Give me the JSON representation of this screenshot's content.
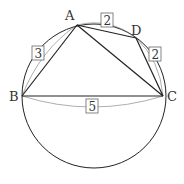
{
  "diagram": {
    "type": "geometry-cyclic-quadrilateral",
    "colors": {
      "stroke": "#222222",
      "arc": "#555555",
      "label_box": "#666666",
      "text": "#333333",
      "background": "#ffffff"
    },
    "circle": {
      "cx": 94,
      "cy": 96,
      "r": 72
    },
    "points": [
      {
        "name": "A",
        "label": "A",
        "x": 77,
        "y": 25,
        "lx": 70,
        "ly": 19
      },
      {
        "name": "B",
        "label": "B",
        "x": 22,
        "y": 96,
        "lx": 10,
        "ly": 101
      },
      {
        "name": "C",
        "label": "C",
        "x": 163,
        "y": 96,
        "lx": 167,
        "ly": 101
      },
      {
        "name": "D",
        "label": "D",
        "x": 136,
        "y": 38,
        "lx": 132,
        "ly": 34
      }
    ],
    "segments": [
      {
        "from": "A",
        "to": "B"
      },
      {
        "from": "A",
        "to": "C"
      },
      {
        "from": "A",
        "to": "D"
      },
      {
        "from": "D",
        "to": "C"
      },
      {
        "from": "B",
        "to": "C"
      }
    ],
    "lengths": [
      {
        "segment": "AB",
        "value": "3",
        "box_x": 32,
        "box_y": 46
      },
      {
        "segment": "AD",
        "value": "2",
        "box_x": 101,
        "box_y": 13
      },
      {
        "segment": "DC",
        "value": "2",
        "box_x": 149,
        "box_y": 47
      },
      {
        "segment": "BC",
        "value": "5",
        "box_x": 84,
        "box_y": 99
      }
    ]
  }
}
